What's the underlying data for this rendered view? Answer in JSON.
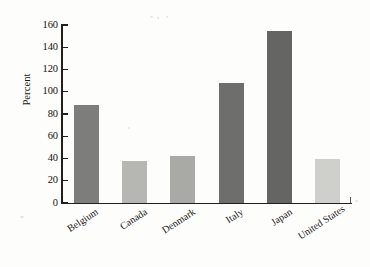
{
  "chart_data": {
    "type": "bar",
    "title": "",
    "subtitle": "",
    "xlabel": "",
    "ylabel": "Percent",
    "ylim": [
      0,
      160
    ],
    "ytick_step": 20,
    "yticks": [
      0,
      20,
      40,
      60,
      80,
      100,
      120,
      140,
      160
    ],
    "ytick_labels": [
      "0",
      "20",
      "40",
      "60",
      "80",
      "100",
      "120",
      "140",
      "160"
    ],
    "grid": false,
    "legend": false,
    "categories": [
      "Belgium",
      "Canada",
      "Denmark",
      "Italy",
      "Japan",
      "United States"
    ],
    "values": [
      88,
      38,
      42,
      108,
      155,
      40
    ],
    "bar_colors": [
      "#7d7d7b",
      "#b6b6b3",
      "#a9a9a6",
      "#6e6e6c",
      "#656563",
      "#cfcfcb"
    ],
    "series": [
      {
        "name": "Percent",
        "values": [
          88,
          38,
          42,
          108,
          155,
          40
        ]
      }
    ]
  },
  "axis": {
    "y_title": "Percent",
    "tick_labels": [
      "160",
      "140",
      "120",
      "100",
      "80",
      "60",
      "40",
      "20",
      "0"
    ]
  },
  "categories": [
    {
      "label": "Belgium"
    },
    {
      "label": "Canada"
    },
    {
      "label": "Denmark"
    },
    {
      "label": "Italy"
    },
    {
      "label": "Japan"
    },
    {
      "label": "United States"
    }
  ]
}
